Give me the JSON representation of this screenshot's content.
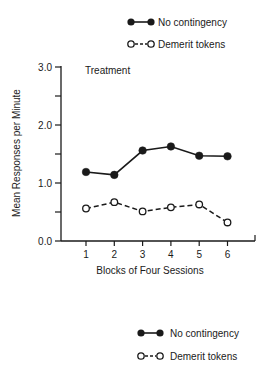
{
  "chart_data": {
    "type": "line",
    "title": "Treatment",
    "xlabel": "Blocks of Four Sessions",
    "ylabel": "Mean Responses per Minute",
    "x": [
      1,
      2,
      3,
      4,
      5,
      6
    ],
    "x_tick_labels": [
      "1",
      "2",
      "3",
      "4",
      "5",
      "6"
    ],
    "y_tick_labels": [
      "0.0",
      "1.0",
      "2.0",
      "3.0"
    ],
    "ylim": [
      0,
      3.0
    ],
    "grid": false,
    "legend_position": "top-right (also repeated below chart)",
    "series": [
      {
        "name": "No contingency",
        "marker": "filled-circle",
        "line": "solid",
        "values": [
          1.19,
          1.14,
          1.56,
          1.63,
          1.47,
          1.46
        ]
      },
      {
        "name": "Demerit tokens",
        "marker": "open-circle",
        "line": "dashed",
        "values": [
          0.56,
          0.67,
          0.51,
          0.58,
          0.63,
          0.32
        ]
      }
    ]
  },
  "legend": {
    "items": [
      {
        "label": "No contingency"
      },
      {
        "label": "Demerit tokens"
      }
    ]
  },
  "colors": {
    "ink": "#1a1a1a",
    "background": "#ffffff"
  }
}
